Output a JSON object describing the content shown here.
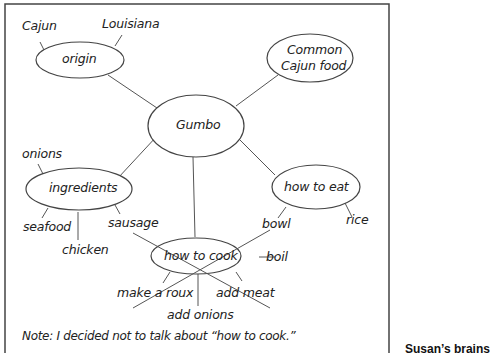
{
  "diagram": {
    "type": "cluster / brainstorm map",
    "center": "Gumbo",
    "nodes": {
      "origin": {
        "label": "origin",
        "details": [
          "Cajun",
          "Louisiana"
        ]
      },
      "common_food": {
        "label_line1": "Common",
        "label_line2": "Cajun food"
      },
      "ingredients": {
        "label": "ingredients",
        "details": [
          "onions",
          "seafood",
          "chicken",
          "sausage"
        ]
      },
      "how_to_eat": {
        "label": "how to eat",
        "details": [
          "bowl",
          "rice"
        ]
      },
      "how_to_cook": {
        "label": "how to cook",
        "details": [
          "make a roux",
          "add onions",
          "add meat",
          "boil"
        ],
        "crossed_out": true
      }
    },
    "note": "Note: I decided not to talk about “how to cook.”",
    "caption": "Susan’s brains"
  },
  "colors": {
    "ink": "#333333",
    "border": "#444444",
    "background": "#ffffff"
  }
}
